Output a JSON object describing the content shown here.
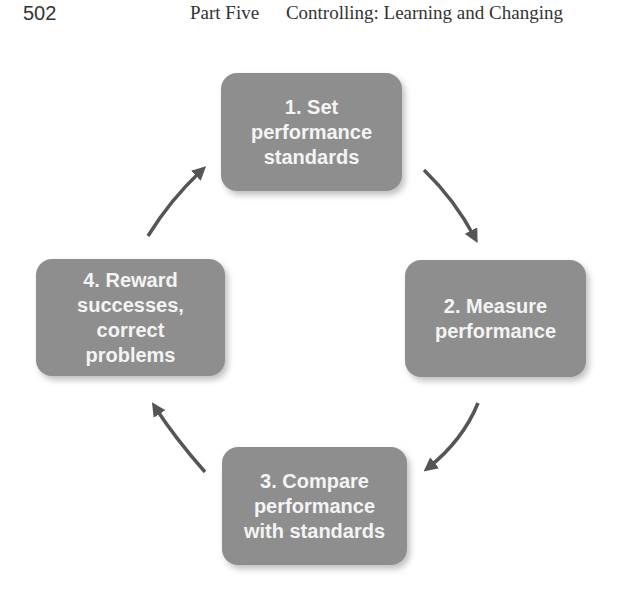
{
  "header": {
    "page_number": "502",
    "part_label": "Part Five",
    "chapter_title": "Controlling: Learning and Changing"
  },
  "diagram": {
    "type": "cycle",
    "steps": [
      {
        "id": 1,
        "label": "1. Set\nperformance\nstandards"
      },
      {
        "id": 2,
        "label": "2. Measure\nperformance"
      },
      {
        "id": 3,
        "label": "3. Compare\nperformance\nwith standards"
      },
      {
        "id": 4,
        "label": "4. Reward\nsuccesses,\ncorrect\nproblems"
      }
    ],
    "arrows": [
      {
        "from": 1,
        "to": 2
      },
      {
        "from": 2,
        "to": 3
      },
      {
        "from": 3,
        "to": 4
      },
      {
        "from": 4,
        "to": 1
      }
    ],
    "colors": {
      "box_fill": "#8e8e8e",
      "box_text": "#f4f4f4",
      "arrow": "#555555"
    }
  }
}
